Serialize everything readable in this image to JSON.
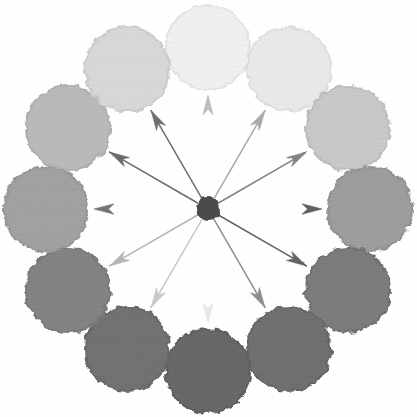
{
  "figure": {
    "title": "Radial Grayscale Value Wheel",
    "background_color": "#fefefe",
    "canvas": {
      "width": 417,
      "height": 417
    },
    "center": {
      "x": 208,
      "y": 209
    },
    "ring_radius": 162,
    "circle_radius": 42,
    "hub": {
      "label": "center-hub",
      "radius": 11,
      "color": "#4c4c4c"
    }
  },
  "chart_data": {
    "type": "scatter",
    "title": "Radial Grayscale Value Wheel",
    "xlabel": "",
    "ylabel": "",
    "legend_position": "none",
    "grid": false,
    "polar": true,
    "angle_units": "degrees clockwise from 12 o'clock",
    "categories": [
      "12 o'clock",
      "1 o'clock",
      "2 o'clock",
      "3 o'clock",
      "4 o'clock",
      "5 o'clock",
      "6 o'clock",
      "7 o'clock",
      "8 o'clock",
      "9 o'clock",
      "10 o'clock",
      "11 o'clock"
    ],
    "series": [
      {
        "name": "circle lightness (0 = black, 100 = white)",
        "values": [
          95,
          92,
          80,
          62,
          49,
          44,
          41,
          45,
          52,
          64,
          74,
          86
        ]
      },
      {
        "name": "arrow lightness (0 = black, 100 = white)",
        "values": [
          72,
          64,
          48,
          36,
          38,
          54,
          90,
          78,
          70,
          44,
          40,
          42
        ]
      }
    ],
    "points": [
      {
        "name": "circle-12-oclock",
        "clock": "12 o'clock",
        "angle_deg": 0,
        "cx": 208,
        "cy": 47,
        "r": 42,
        "fill": "#f0f0f0",
        "edge": "#e2e2e2",
        "lightness": 95,
        "arrow_color": "#bdbdbd",
        "arrow_lightness": 72
      },
      {
        "name": "circle-1-oclock",
        "clock": "1 o'clock",
        "angle_deg": 30,
        "cx": 289,
        "cy": 69,
        "r": 42,
        "fill": "#e9e9e9",
        "edge": "#dcdcdc",
        "lightness": 92,
        "arrow_color": "#a8a8a8",
        "arrow_lightness": 64
      },
      {
        "name": "circle-2-oclock",
        "clock": "2 o'clock",
        "angle_deg": 60,
        "cx": 348,
        "cy": 128,
        "r": 42,
        "fill": "#c9c9c9",
        "edge": "#bcbcbc",
        "lightness": 80,
        "arrow_color": "#828282",
        "arrow_lightness": 48
      },
      {
        "name": "circle-3-oclock",
        "clock": "3 o'clock",
        "angle_deg": 90,
        "cx": 370,
        "cy": 209,
        "r": 42,
        "fill": "#9e9e9e",
        "edge": "#919191",
        "lightness": 62,
        "arrow_color": "#5f5f5f",
        "arrow_lightness": 36
      },
      {
        "name": "circle-4-oclock",
        "clock": "4 o'clock",
        "angle_deg": 120,
        "cx": 348,
        "cy": 290,
        "r": 42,
        "fill": "#7d7d7d",
        "edge": "#707070",
        "lightness": 49,
        "arrow_color": "#636363",
        "arrow_lightness": 38
      },
      {
        "name": "circle-5-oclock",
        "clock": "5 o'clock",
        "angle_deg": 150,
        "cx": 289,
        "cy": 349,
        "r": 42,
        "fill": "#717171",
        "edge": "#656565",
        "lightness": 44,
        "arrow_color": "#8e8e8e",
        "arrow_lightness": 54
      },
      {
        "name": "circle-6-oclock",
        "clock": "6 o'clock",
        "angle_deg": 180,
        "cx": 208,
        "cy": 371,
        "r": 42,
        "fill": "#696969",
        "edge": "#5d5d5d",
        "lightness": 41,
        "arrow_color": "#e6e6e6",
        "arrow_lightness": 90
      },
      {
        "name": "circle-7-oclock",
        "clock": "7 o'clock",
        "angle_deg": 210,
        "cx": 127,
        "cy": 349,
        "r": 42,
        "fill": "#737373",
        "edge": "#676767",
        "lightness": 45,
        "arrow_color": "#c8c8c8",
        "arrow_lightness": 78
      },
      {
        "name": "circle-8-oclock",
        "clock": "8 o'clock",
        "angle_deg": 240,
        "cx": 68,
        "cy": 290,
        "r": 42,
        "fill": "#848484",
        "edge": "#787878",
        "lightness": 52,
        "arrow_color": "#b5b5b5",
        "arrow_lightness": 70
      },
      {
        "name": "circle-9-oclock",
        "clock": "9 o'clock",
        "angle_deg": 270,
        "cx": 46,
        "cy": 209,
        "r": 42,
        "fill": "#a2a2a2",
        "edge": "#969696",
        "lightness": 64,
        "arrow_color": "#757575",
        "arrow_lightness": 44
      },
      {
        "name": "circle-10-oclock",
        "clock": "10 o'clock",
        "angle_deg": 300,
        "cx": 68,
        "cy": 128,
        "r": 42,
        "fill": "#bababa",
        "edge": "#aeaeae",
        "lightness": 74,
        "arrow_color": "#6b6b6b",
        "arrow_lightness": 40
      },
      {
        "name": "circle-11-oclock",
        "clock": "11 o'clock",
        "angle_deg": 330,
        "cx": 127,
        "cy": 69,
        "r": 42,
        "fill": "#d8d8d8",
        "edge": "#cbcbcb",
        "lightness": 86,
        "arrow_color": "#6f6f6f",
        "arrow_lightness": 42
      }
    ]
  }
}
